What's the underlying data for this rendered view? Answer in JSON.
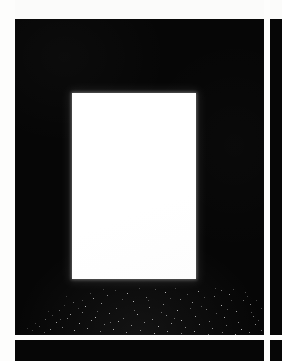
{
  "sheet": {
    "title": "Contact sheet frame",
    "width": 282,
    "height": 361,
    "background_color": "#fbfbfa",
    "gutter_color": "#fdfdfc",
    "frame_color": "#060606",
    "highlight_color": "#ffffff",
    "layout_note": "Grid of black photographic frames separated by white gutters; one large frame visible at upper-left, partial frames at right and bottom."
  },
  "margin": {
    "label": "left page margin",
    "x": 0,
    "width": 15,
    "color": "#fdfdfc"
  },
  "gutters": [
    {
      "name": "vertical-gutter",
      "orientation": "v",
      "x": 264,
      "width": 6,
      "color": "#fdfdfc"
    },
    {
      "name": "horizontal-gutter",
      "orientation": "h",
      "y": 335,
      "height": 5,
      "color": "#fdfdfc"
    }
  ],
  "frames": [
    {
      "name": "main-frame",
      "position": "top-left",
      "x": 15,
      "y": 19,
      "width": 249,
      "height": 316,
      "color": "#060606",
      "has_light_panel": true,
      "has_speckles": true
    },
    {
      "name": "right-frame",
      "position": "top-right",
      "x": 270,
      "y": 19,
      "width": 12,
      "height": 316,
      "color": "#060606",
      "has_light_panel": false,
      "has_speckles": false
    },
    {
      "name": "bottom-frame",
      "position": "bottom-left",
      "x": 15,
      "y": 340,
      "width": 249,
      "height": 21,
      "color": "#060606",
      "has_light_panel": false,
      "has_speckles": false
    },
    {
      "name": "corner-frame",
      "position": "bottom-right",
      "x": 270,
      "y": 340,
      "width": 12,
      "height": 21,
      "color": "#060606",
      "has_light_panel": false,
      "has_speckles": false
    }
  ],
  "light_panel": {
    "name": "blown-out-window",
    "x": 72,
    "y": 93,
    "width": 124,
    "height": 186,
    "color": "#ffffff",
    "description": "Bright overexposed white rectangle centered in the main frame"
  },
  "speckle_field": {
    "name": "speckle-field",
    "description": "Scattered small white specks along the lower portion of the main frame, densest near the bottom edge",
    "count": 118,
    "color": "#ffffff",
    "region": {
      "x": 15,
      "y": 288,
      "width": 249,
      "height": 47
    },
    "points": [
      [
        78,
        10,
        1.1,
        0.85
      ],
      [
        92,
        7,
        1.0,
        0.7
      ],
      [
        112,
        5,
        1.1,
        0.9
      ],
      [
        131,
        9,
        1.0,
        0.62
      ],
      [
        150,
        4,
        1.2,
        0.95
      ],
      [
        165,
        11,
        1.0,
        0.72
      ],
      [
        183,
        3,
        1.1,
        0.88
      ],
      [
        199,
        8,
        1.0,
        0.66
      ],
      [
        214,
        6,
        1.1,
        0.8
      ],
      [
        228,
        12,
        1.0,
        0.58
      ],
      [
        58,
        14,
        1.0,
        0.55
      ],
      [
        70,
        18,
        1.2,
        0.92
      ],
      [
        86,
        15,
        1.1,
        0.78
      ],
      [
        101,
        20,
        1.0,
        0.64
      ],
      [
        118,
        13,
        1.2,
        0.96
      ],
      [
        134,
        19,
        1.1,
        0.83
      ],
      [
        148,
        16,
        1.0,
        0.7
      ],
      [
        162,
        22,
        1.2,
        0.9
      ],
      [
        177,
        14,
        1.1,
        0.76
      ],
      [
        191,
        21,
        1.0,
        0.62
      ],
      [
        206,
        17,
        1.2,
        0.93
      ],
      [
        221,
        23,
        1.1,
        0.8
      ],
      [
        235,
        16,
        1.0,
        0.68
      ],
      [
        44,
        22,
        1.0,
        0.52
      ],
      [
        55,
        26,
        1.1,
        0.85
      ],
      [
        67,
        24,
        1.0,
        0.66
      ],
      [
        80,
        29,
        1.2,
        0.94
      ],
      [
        94,
        25,
        1.1,
        0.79
      ],
      [
        108,
        30,
        1.0,
        0.63
      ],
      [
        122,
        26,
        1.2,
        0.91
      ],
      [
        137,
        31,
        1.1,
        0.77
      ],
      [
        151,
        27,
        1.0,
        0.69
      ],
      [
        166,
        32,
        1.2,
        0.95
      ],
      [
        180,
        28,
        1.1,
        0.81
      ],
      [
        194,
        33,
        1.0,
        0.65
      ],
      [
        209,
        29,
        1.2,
        0.89
      ],
      [
        223,
        34,
        1.1,
        0.74
      ],
      [
        238,
        28,
        1.0,
        0.6
      ],
      [
        30,
        31,
        1.0,
        0.5
      ],
      [
        41,
        34,
        1.1,
        0.82
      ],
      [
        52,
        30,
        1.0,
        0.67
      ],
      [
        64,
        35,
        1.2,
        0.93
      ],
      [
        76,
        32,
        1.1,
        0.78
      ],
      [
        89,
        36,
        1.0,
        0.64
      ],
      [
        103,
        33,
        1.2,
        0.9
      ],
      [
        116,
        37,
        1.1,
        0.76
      ],
      [
        129,
        34,
        1.0,
        0.71
      ],
      [
        143,
        38,
        1.2,
        0.94
      ],
      [
        156,
        35,
        1.1,
        0.8
      ],
      [
        170,
        39,
        1.0,
        0.66
      ],
      [
        184,
        36,
        1.2,
        0.88
      ],
      [
        197,
        40,
        1.1,
        0.75
      ],
      [
        211,
        37,
        1.0,
        0.62
      ],
      [
        226,
        41,
        1.2,
        0.92
      ],
      [
        240,
        36,
        1.1,
        0.7
      ],
      [
        24,
        38,
        1.0,
        0.48
      ],
      [
        35,
        41,
        1.1,
        0.8
      ],
      [
        47,
        39,
        1.0,
        0.65
      ],
      [
        59,
        42,
        1.2,
        0.91
      ],
      [
        72,
        40,
        1.1,
        0.77
      ],
      [
        85,
        43,
        1.0,
        0.61
      ],
      [
        98,
        41,
        1.2,
        0.89
      ],
      [
        111,
        44,
        1.1,
        0.74
      ],
      [
        125,
        42,
        1.0,
        0.68
      ],
      [
        139,
        45,
        1.2,
        0.93
      ],
      [
        152,
        43,
        1.1,
        0.79
      ],
      [
        166,
        45,
        1.0,
        0.63
      ],
      [
        179,
        43,
        1.2,
        0.87
      ],
      [
        193,
        46,
        1.1,
        0.73
      ],
      [
        207,
        44,
        1.0,
        0.59
      ],
      [
        220,
        46,
        1.2,
        0.9
      ],
      [
        234,
        44,
        1.1,
        0.67
      ],
      [
        246,
        42,
        1.0,
        0.55
      ],
      [
        100,
        2,
        0.9,
        0.45
      ],
      [
        140,
        1,
        0.9,
        0.5
      ],
      [
        172,
        6,
        0.9,
        0.55
      ],
      [
        206,
        2,
        1.0,
        0.6
      ],
      [
        218,
        1,
        0.9,
        0.48
      ],
      [
        63,
        20,
        0.9,
        0.46
      ],
      [
        49,
        17,
        0.9,
        0.42
      ],
      [
        155,
        10,
        0.9,
        0.52
      ],
      [
        189,
        9,
        0.9,
        0.5
      ],
      [
        232,
        8,
        0.9,
        0.44
      ],
      [
        37,
        27,
        0.9,
        0.47
      ],
      [
        20,
        35,
        0.9,
        0.4
      ],
      [
        246,
        20,
        0.9,
        0.43
      ],
      [
        243,
        32,
        0.9,
        0.51
      ],
      [
        29,
        44,
        0.9,
        0.54
      ],
      [
        17,
        42,
        0.9,
        0.38
      ],
      [
        88,
        1,
        0.9,
        0.4
      ],
      [
        124,
        0,
        0.9,
        0.44
      ],
      [
        160,
        0,
        0.9,
        0.42
      ],
      [
        200,
        0,
        0.9,
        0.46
      ],
      [
        230,
        4,
        0.9,
        0.49
      ],
      [
        67,
        12,
        0.9,
        0.45
      ],
      [
        82,
        23,
        0.9,
        0.58
      ],
      [
        107,
        11,
        0.9,
        0.53
      ],
      [
        146,
        24,
        0.9,
        0.61
      ],
      [
        175,
        20,
        0.9,
        0.56
      ],
      [
        201,
        25,
        0.9,
        0.59
      ],
      [
        216,
        12,
        0.9,
        0.47
      ],
      [
        241,
        12,
        0.9,
        0.41
      ],
      [
        33,
        23,
        0.9,
        0.39
      ],
      [
        45,
        31,
        0.9,
        0.57
      ],
      [
        75,
        5,
        0.9,
        0.43
      ],
      [
        95,
        34,
        0.9,
        0.62
      ],
      [
        119,
        22,
        0.9,
        0.6
      ],
      [
        133,
        12,
        0.9,
        0.51
      ],
      [
        159,
        30,
        0.9,
        0.64
      ],
      [
        186,
        18,
        0.9,
        0.54
      ],
      [
        212,
        21,
        0.9,
        0.57
      ],
      [
        236,
        24,
        0.9,
        0.49
      ],
      [
        51,
        8,
        0.9,
        0.36
      ],
      [
        249,
        38,
        0.9,
        0.45
      ],
      [
        12,
        40,
        0.9,
        0.34
      ],
      [
        252,
        28,
        0.9,
        0.38
      ]
    ]
  }
}
